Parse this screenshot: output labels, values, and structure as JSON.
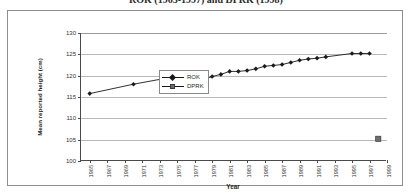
{
  "title": "ROK (1965-1997) and DPRK (1998)",
  "axis": {
    "xlabel": "Year",
    "ylabel": "Mean reported height (cm)"
  },
  "legend": {
    "rok_label": "ROK",
    "dprk_label": "DPRK"
  },
  "chart_data": {
    "type": "line",
    "title": "ROK (1965-1997) and DPRK (1998)",
    "xlabel": "Year",
    "ylabel": "Mean reported height (cm)",
    "xlim": [
      1964,
      1999
    ],
    "ylim": [
      100,
      130
    ],
    "ytick_values": [
      100,
      105,
      110,
      115,
      120,
      125,
      130
    ],
    "ytick_labels": [
      "100",
      "105",
      "110",
      "115",
      "120",
      "125",
      "130"
    ],
    "xtick_values": [
      1965,
      1967,
      1969,
      1971,
      1973,
      1975,
      1977,
      1979,
      1981,
      1983,
      1985,
      1987,
      1989,
      1991,
      1993,
      1995,
      1997,
      1999
    ],
    "xtick_labels": [
      "1965",
      "1967",
      "1969",
      "1971",
      "1973",
      "1975",
      "1977",
      "1979",
      "1981",
      "1983",
      "1985",
      "1987",
      "1989",
      "1991",
      "1993",
      "1995",
      "1997",
      "1999"
    ],
    "grid": "horizontal",
    "legend_position": "upper-left",
    "series": [
      {
        "name": "ROK",
        "marker": "diamond",
        "color": "#1a1a1a",
        "points": [
          {
            "x": 1965,
            "y": 115.8
          },
          {
            "x": 1970,
            "y": 118.0
          },
          {
            "x": 1974,
            "y": 119.5
          },
          {
            "x": 1975,
            "y": 118.3
          },
          {
            "x": 1976,
            "y": 118.6
          },
          {
            "x": 1977,
            "y": 118.7
          },
          {
            "x": 1978,
            "y": 119.1
          },
          {
            "x": 1979,
            "y": 119.8
          },
          {
            "x": 1980,
            "y": 120.3
          },
          {
            "x": 1981,
            "y": 121.0
          },
          {
            "x": 1982,
            "y": 121.0
          },
          {
            "x": 1983,
            "y": 121.2
          },
          {
            "x": 1984,
            "y": 121.6
          },
          {
            "x": 1985,
            "y": 122.2
          },
          {
            "x": 1986,
            "y": 122.4
          },
          {
            "x": 1987,
            "y": 122.6
          },
          {
            "x": 1988,
            "y": 123.1
          },
          {
            "x": 1989,
            "y": 123.6
          },
          {
            "x": 1990,
            "y": 123.9
          },
          {
            "x": 1991,
            "y": 124.1
          },
          {
            "x": 1992,
            "y": 124.4
          },
          {
            "x": 1995,
            "y": 125.2
          },
          {
            "x": 1996,
            "y": 125.2
          },
          {
            "x": 1997,
            "y": 125.2
          }
        ]
      },
      {
        "name": "DPRK",
        "marker": "square",
        "color": "#6e6e6e",
        "points": [
          {
            "x": 1998,
            "y": 105.2
          }
        ]
      }
    ]
  }
}
